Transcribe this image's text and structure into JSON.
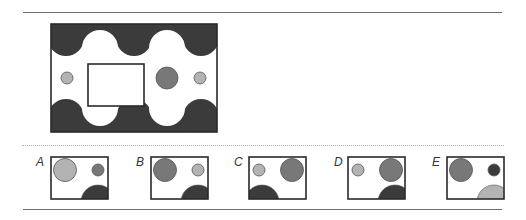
{
  "colors": {
    "dark": "#3b3b3b",
    "mid": "#787878",
    "light": "#b3b3b3",
    "outline": "#2a2a2a",
    "background": "#ffffff"
  },
  "question": {
    "description": "Pattern figure with cut-out window",
    "bands": [
      "dark wavy band top",
      "dark wavy band bottom"
    ],
    "circles": [
      {
        "position": "left",
        "size": "small",
        "fill": "light"
      },
      {
        "position": "right-center",
        "size": "large",
        "fill": "mid"
      },
      {
        "position": "right",
        "size": "small",
        "fill": "light"
      }
    ]
  },
  "options": [
    {
      "label": "A",
      "big_circle": {
        "side": "left",
        "fill": "light"
      },
      "small_circle": {
        "side": "right",
        "fill": "mid"
      },
      "semicircle": {
        "corner": "bottom-right",
        "fill": "dark"
      }
    },
    {
      "label": "B",
      "big_circle": {
        "side": "left",
        "fill": "mid"
      },
      "small_circle": {
        "side": "right",
        "fill": "light"
      },
      "semicircle": {
        "corner": "bottom-right",
        "fill": "dark"
      }
    },
    {
      "label": "C",
      "big_circle": {
        "side": "right",
        "fill": "mid"
      },
      "small_circle": {
        "side": "left",
        "fill": "light"
      },
      "semicircle": {
        "corner": "bottom-left",
        "fill": "dark"
      }
    },
    {
      "label": "D",
      "big_circle": {
        "side": "right",
        "fill": "mid"
      },
      "small_circle": {
        "side": "left",
        "fill": "light"
      },
      "semicircle": {
        "corner": "bottom-right",
        "fill": "dark"
      }
    },
    {
      "label": "E",
      "big_circle": {
        "side": "left",
        "fill": "mid"
      },
      "small_circle": {
        "side": "right",
        "fill": "dark"
      },
      "semicircle": {
        "corner": "bottom-right",
        "fill": "light"
      }
    }
  ]
}
